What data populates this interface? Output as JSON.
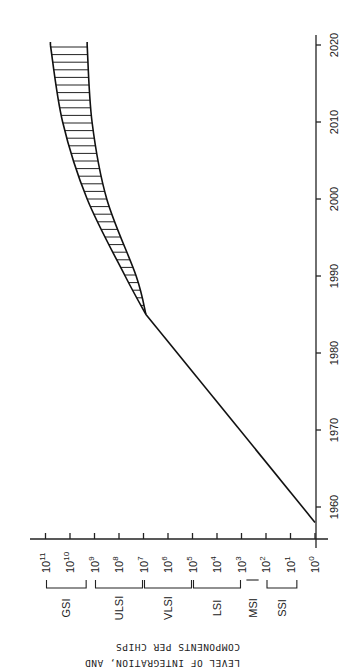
{
  "chart_data": {
    "type": "line",
    "orientation": "rotated-90-ccw",
    "title": "",
    "xlabel": "",
    "ylabel": "LEVEL OF INTEGRATION, AND COMPONENTS PER CHIPS",
    "ylabel_lines": [
      "LEVEL OF INTEGRATION, AND",
      "COMPONENTS PER CHIPS"
    ],
    "x_ticks": [
      1960,
      1970,
      1980,
      1990,
      2000,
      2010,
      2020
    ],
    "xlim": [
      1957,
      2022
    ],
    "y_scale": "log10",
    "y_ticks": [
      {
        "exp": 0,
        "label": "10",
        "sup": "0"
      },
      {
        "exp": 1,
        "label": "10",
        "sup": "1"
      },
      {
        "exp": 2,
        "label": "10",
        "sup": "2"
      },
      {
        "exp": 3,
        "label": "10",
        "sup": "3"
      },
      {
        "exp": 4,
        "label": "10",
        "sup": "4"
      },
      {
        "exp": 5,
        "label": "10",
        "sup": "5"
      },
      {
        "exp": 6,
        "label": "10",
        "sup": "6"
      },
      {
        "exp": 7,
        "label": "10",
        "sup": "7"
      },
      {
        "exp": 8,
        "label": "10",
        "sup": "8"
      },
      {
        "exp": 9,
        "label": "10",
        "sup": "9"
      },
      {
        "exp": 10,
        "label": "10",
        "sup": "10"
      },
      {
        "exp": 11,
        "label": "10",
        "sup": "11"
      }
    ],
    "ylim_exp": [
      0,
      11
    ],
    "integration_levels": [
      {
        "name": "SSI",
        "from_exp": 0.7,
        "to_exp": 2
      },
      {
        "name": "MSI",
        "from_exp": 2.3,
        "to_exp": 2.8
      },
      {
        "name": "LSI",
        "from_exp": 3,
        "to_exp": 5
      },
      {
        "name": "VLSI",
        "from_exp": 5,
        "to_exp": 7
      },
      {
        "name": "ULSI",
        "from_exp": 7,
        "to_exp": 9
      },
      {
        "name": "GSI",
        "from_exp": 9.3,
        "to_exp": 11
      }
    ],
    "series": [
      {
        "name": "Historical trend",
        "x": [
          1958,
          1960,
          1970,
          1980,
          1985
        ],
        "log10_values": [
          0,
          0.6,
          3.5,
          5.65,
          6.9
        ]
      },
      {
        "name": "Projection upper bound",
        "x": [
          1985,
          1990,
          2000,
          2010,
          2020
        ],
        "log10_values": [
          6.9,
          7.75,
          9.3,
          10.3,
          10.8
        ]
      },
      {
        "name": "Projection lower bound",
        "x": [
          1985,
          1990,
          2000,
          2010,
          2020
        ],
        "log10_values": [
          6.9,
          7.3,
          8.5,
          9.1,
          9.3
        ]
      }
    ],
    "shaded_region": "hatched band between projection upper and lower bounds (1985-2020)",
    "grid": false,
    "legend": null
  }
}
